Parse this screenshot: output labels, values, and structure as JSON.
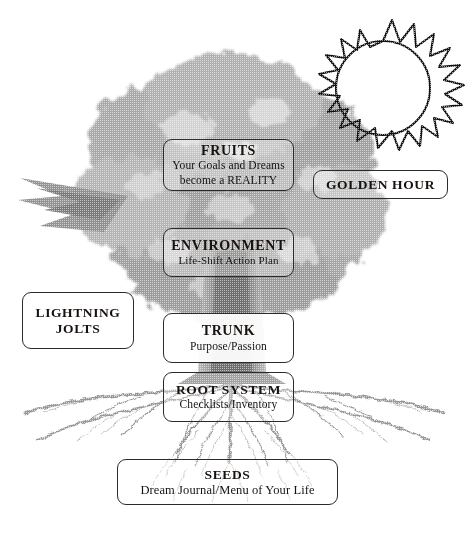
{
  "diagram": {
    "background_color": "#ffffff",
    "ink_color": "#17120f",
    "tree_tone": "#9a9a9a"
  },
  "boxes": {
    "fruits": {
      "title": "FRUITS",
      "subtitle_line1": "Your Goals and Dreams",
      "subtitle_line2": "become a REALITY"
    },
    "environment": {
      "title": "ENVIRONMENT",
      "subtitle": "Life-Shift Action Plan"
    },
    "trunk": {
      "title": "TRUNK",
      "subtitle": "Purpose/Passion"
    },
    "root_system": {
      "title": "ROOT SYSTEM",
      "subtitle": "Checklists/Inventory"
    },
    "seeds": {
      "title": "SEEDS",
      "subtitle": "Dream Journal/Menu of Your Life"
    },
    "lightning_jolts": {
      "title_line1": "LIGHTNING",
      "title_line2": "JOLTS"
    },
    "golden_hour": {
      "title": "GOLDEN HOUR"
    }
  },
  "illustrations": {
    "sun": "sun-icon",
    "tree_canopy": "tree-canopy-illustration",
    "tree_trunk": "tree-trunk-illustration",
    "tree_roots": "tree-roots-illustration",
    "left_branch": "left-branch-illustration"
  }
}
